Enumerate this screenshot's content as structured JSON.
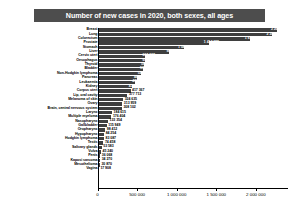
{
  "chart_data": {
    "type": "bar",
    "orientation": "horizontal",
    "title": "Number of new cases in 2020, both sexes, all ages",
    "xlabel": "",
    "ylabel": "",
    "xlim": [
      0,
      2400000
    ],
    "grid": false,
    "legend": null,
    "xticks": [
      0,
      500000,
      1000000,
      1500000,
      2000000
    ],
    "xtick_labels": [
      "0",
      "500 000",
      "1 000 000",
      "1 500 000",
      "2 000 000"
    ],
    "categories": [
      "Breast",
      "Lung",
      "Colorectum",
      "Prostate",
      "Stomach",
      "Liver",
      "Cervix uteri",
      "Oesophagus",
      "Thyroid",
      "Bladder",
      "Non-Hodgkin lymphoma",
      "Pancreas",
      "Leukaemia",
      "Kidney",
      "Corpus uteri",
      "Lip, oral cavity",
      "Melanoma of skin",
      "Ovary",
      "Brain, central nervous system",
      "Larynx",
      "Multiple myeloma",
      "Nasopharynx",
      "Gallbladder",
      "Oropharynx",
      "Hypopharynx",
      "Hodgkin lymphoma",
      "Testis",
      "Salivary glands",
      "Vulva",
      "Penis",
      "Kaposi sarcoma",
      "Mesothelioma",
      "Vagina"
    ],
    "values": [
      2261419,
      2206771,
      1931590,
      1414259,
      1089103,
      905677,
      604127,
      604100,
      586202,
      573278,
      544352,
      495773,
      474519,
      431288,
      417367,
      377713,
      324635,
      313959,
      308102,
      184615,
      176404,
      133354,
      115949,
      98412,
      84254,
      83087,
      74458,
      53583,
      45240,
      36068,
      34270,
      30870,
      17908
    ],
    "value_labels": [
      "2 261 419",
      "2 206 771",
      "1 931 590",
      "1 414 259",
      "1 089 103",
      "905 677",
      "604 127",
      "604 100",
      "586 202",
      "573 278",
      "544 352",
      "495 773",
      "474 519",
      "431 288",
      "417 367",
      "377 713",
      "324 635",
      "313 959",
      "308 102",
      "184 615",
      "176 404",
      "133 354",
      "115 949",
      "98 412",
      "84 254",
      "83 087",
      "74 458",
      "53 583",
      "45 240",
      "36 068",
      "34 270",
      "30 870",
      "17 908"
    ],
    "bar_color": "#3f3f3f",
    "title_background": "#4d4d4d",
    "title_color": "#ffffff"
  }
}
